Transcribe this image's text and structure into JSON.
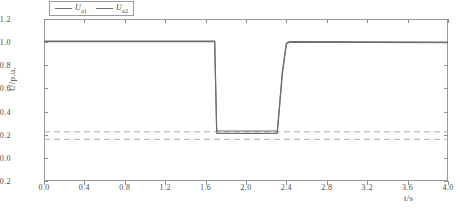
{
  "chart_data": {
    "type": "line",
    "title": "",
    "subtitle": "",
    "xlabel": "t/s",
    "ylabel": "U/p.u.",
    "xlim": [
      0.0,
      4.0
    ],
    "ylim": [
      -0.2,
      1.2
    ],
    "xticks": [
      "0.0",
      "0.4",
      "0.8",
      "1.2",
      "1.6",
      "2.0",
      "2.4",
      "2.8",
      "3.2",
      "3.6",
      "4.0"
    ],
    "xtick_values": [
      0.0,
      0.4,
      0.8,
      1.2,
      1.6,
      2.0,
      2.4,
      2.8,
      3.2,
      3.6,
      4.0
    ],
    "yticks": [
      "-0.2",
      "0.0",
      "0.2",
      "0.4",
      "0.6",
      "0.8",
      "1.0",
      "1.2"
    ],
    "ytick_values": [
      -0.2,
      0.0,
      0.2,
      0.4,
      0.6,
      0.8,
      1.0,
      1.2
    ],
    "grid": false,
    "legend_position": "top-left",
    "series": [
      {
        "name": "U_a1",
        "label": "U",
        "sublabel": "a1",
        "color": "#6f6f6f",
        "x": [
          0.0,
          1.69,
          1.7,
          1.71,
          2.31,
          2.36,
          2.4,
          2.43,
          4.0
        ],
        "values": [
          1.005,
          1.005,
          0.6,
          0.212,
          0.212,
          0.72,
          0.985,
          1.0,
          0.995
        ]
      },
      {
        "name": "U_a2",
        "label": "U",
        "sublabel": "a2",
        "color": "#6f6f6f",
        "x": [
          0.0,
          1.69,
          1.7,
          1.71,
          2.31,
          2.36,
          2.4,
          2.43,
          4.0
        ],
        "values": [
          1.01,
          1.01,
          0.62,
          0.232,
          0.232,
          0.75,
          0.992,
          1.005,
          1.0
        ]
      }
    ],
    "reference_lines": [
      {
        "name": "upper-threshold",
        "y": 0.225,
        "style": "dashed",
        "color": "#a8a8a8"
      },
      {
        "name": "lower-threshold",
        "y": 0.16,
        "style": "dashed",
        "color": "#a8a8a8"
      }
    ]
  }
}
